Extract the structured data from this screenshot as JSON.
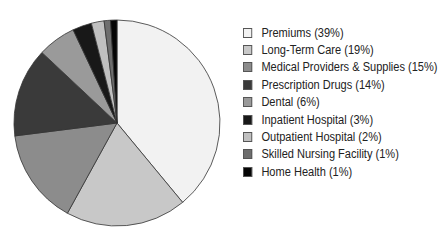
{
  "chart_data": {
    "type": "pie",
    "title": "",
    "start_angle_deg": 0,
    "direction": "clockwise",
    "legend_position": "right",
    "categories": [
      "Premiums",
      "Long-Term Care",
      "Medical Providers & Supplies",
      "Prescription Drugs",
      "Dental",
      "Inpatient Hospital",
      "Outpatient Hospital",
      "Skilled Nursing Facility",
      "Home Health"
    ],
    "values": [
      39,
      19,
      15,
      14,
      6,
      3,
      2,
      1,
      1
    ],
    "colors": [
      "#f2f2f2",
      "#c8c8c8",
      "#8c8c8c",
      "#3a3a3a",
      "#9a9a9a",
      "#181818",
      "#c0c0c0",
      "#6e6e6e",
      "#050505"
    ],
    "legend_labels": [
      "Premiums (39%)",
      "Long-Term Care (19%)",
      "Medical Providers & Supplies (15%)",
      "Prescription Drugs (14%)",
      "Dental (6%)",
      "Inpatient Hospital (3%)",
      "Outpatient Hospital (2%)",
      "Skilled Nursing Facility (1%)",
      "Home Health (1%)"
    ]
  }
}
